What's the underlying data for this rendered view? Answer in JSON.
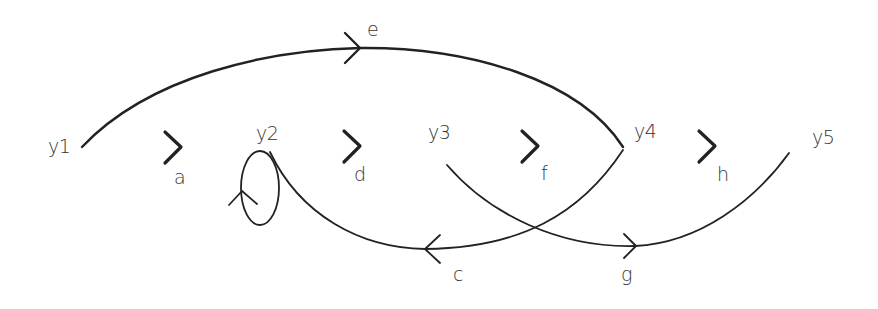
{
  "diagram": {
    "type": "signal-flow-graph",
    "colors": {
      "stroke": "#222222",
      "text": "#333333",
      "background": "#ffffff"
    },
    "nodes": [
      {
        "id": "y1",
        "label": "y1"
      },
      {
        "id": "y2",
        "label": "y2"
      },
      {
        "id": "y3",
        "label": "y3"
      },
      {
        "id": "y4",
        "label": "y4"
      },
      {
        "id": "y5",
        "label": "y5"
      }
    ],
    "edges": [
      {
        "label": "a",
        "from": "y1",
        "to": "y2"
      },
      {
        "label": "b",
        "from": "y2",
        "to": "y2",
        "note": "self-loop (unlabeled)"
      },
      {
        "label": "c",
        "from": "y4",
        "to": "y2"
      },
      {
        "label": "d",
        "from": "y2",
        "to": "y3"
      },
      {
        "label": "e",
        "from": "y1",
        "to": "y4"
      },
      {
        "label": "f",
        "from": "y3",
        "to": "y4"
      },
      {
        "label": "g",
        "from": "y3",
        "to": "y5"
      },
      {
        "label": "h",
        "from": "y4",
        "to": "y5"
      }
    ],
    "edge_labels": {
      "a": "a",
      "c": "c",
      "d": "d",
      "e": "e",
      "f": "f",
      "g": "g",
      "h": "h"
    }
  }
}
